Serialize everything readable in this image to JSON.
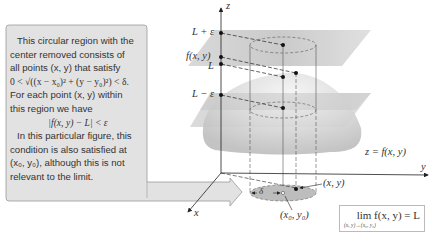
{
  "callout": {
    "lines": [
      "This circular region with the",
      "center removed consists of",
      "all points (x, y) that satisfy",
      "0 < √((x − x₀)² + (y − y₀)²) < δ.",
      "For each point (x, y) within",
      "this region we have",
      "|f(x, y) − L| < ε",
      "In this particular figure, this",
      "condition is also satisfied at",
      "(x₀, y₀), although this is not",
      "relevant to the limit."
    ],
    "fill_color": "#e2e2e2",
    "border_color": "#9a9a9a"
  },
  "axes": {
    "z_label": "z",
    "y_label": "y",
    "x_label": "x"
  },
  "z_axis_labels": {
    "upper": "L + ε",
    "value": "f(x, y)",
    "limit": "L",
    "lower": "L − ε"
  },
  "surface_label": "z = f(x, y)",
  "point_labels": {
    "point": "(x, y)",
    "center": "(x₀, y₀)",
    "radius": "δ"
  },
  "limit_box": {
    "main": "lim f(x, y) = L",
    "subscript": "(x, y)→(x₀, y₀)"
  },
  "colors": {
    "plane": "#c8c8c8",
    "surface": "#d6d6d6",
    "disc": "#bdbdbd",
    "axis": "#222222",
    "dot": "#111111"
  }
}
